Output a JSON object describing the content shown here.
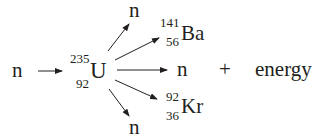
{
  "reaction": {
    "incoming_neutron": "n",
    "target": {
      "symbol": "U",
      "mass_number": "235",
      "atomic_number": "92"
    },
    "products": {
      "neutron_top": "n",
      "barium": {
        "symbol": "Ba",
        "mass_number": "141",
        "atomic_number": "56"
      },
      "neutron_middle": "n",
      "krypton": {
        "symbol": "Kr",
        "mass_number": "92",
        "atomic_number": "36"
      },
      "neutron_bottom": "n"
    },
    "plus": "+",
    "energy": "energy"
  },
  "colors": {
    "ink": "#231f20",
    "background": "#ffffff"
  }
}
